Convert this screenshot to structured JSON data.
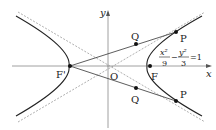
{
  "diagram": {
    "type": "hyperbola",
    "equation": {
      "x_num": "x²",
      "x_den": "9",
      "minus": "−",
      "y_num": "y²",
      "y_den": "3",
      "equals": "=1"
    },
    "axes": {
      "x_label": "x",
      "y_label": "y",
      "origin_label": "O"
    },
    "points": {
      "focus_left": "F'",
      "focus_right": "F",
      "P_upper": "P",
      "P_lower": "P",
      "Q_upper": "Q",
      "Q_lower": "Q"
    },
    "colors": {
      "curve": "#222222",
      "asymptote": "#999999",
      "axis": "#888888"
    }
  }
}
